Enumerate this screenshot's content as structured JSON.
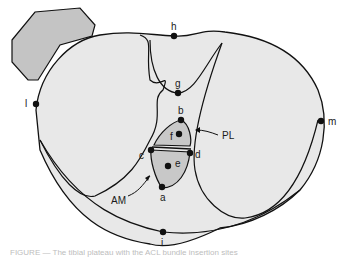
{
  "diagram": {
    "colors": {
      "plateau_fill": "#e8e8e8",
      "fibula_fill": "#c4c4c4",
      "footprint_fill": "#c8c8c8",
      "stroke": "#111111"
    },
    "points": [
      {
        "id": "a",
        "label": "a"
      },
      {
        "id": "b",
        "label": "b"
      },
      {
        "id": "c",
        "label": "c"
      },
      {
        "id": "d",
        "label": "d"
      },
      {
        "id": "e",
        "label": "e"
      },
      {
        "id": "f",
        "label": "f"
      },
      {
        "id": "g",
        "label": "g"
      },
      {
        "id": "h",
        "label": "h"
      },
      {
        "id": "i",
        "label": "i"
      },
      {
        "id": "l",
        "label": "l"
      },
      {
        "id": "m",
        "label": "m"
      }
    ],
    "callouts": {
      "am": "AM",
      "pl": "PL"
    },
    "caption": "FIGURE — The tibial plateau with the ACL bundle insertion sites"
  }
}
